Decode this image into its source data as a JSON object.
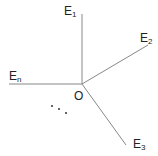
{
  "diagram": {
    "center": {
      "label": "O",
      "x": 82,
      "y": 84
    },
    "rays": [
      {
        "name": "E",
        "sub": "1",
        "x2": 82,
        "y2": 14,
        "lx": 64,
        "ly": 15
      },
      {
        "name": "E",
        "sub": "2",
        "x2": 148,
        "y2": 45,
        "lx": 140,
        "ly": 42
      },
      {
        "name": "E",
        "sub": "3",
        "x2": 126,
        "y2": 145,
        "lx": 133,
        "ly": 148
      },
      {
        "name": "E",
        "sub": "n",
        "x2": 9,
        "y2": 84,
        "lx": 9,
        "ly": 80
      }
    ],
    "ellipsis_dots": [
      {
        "x": 52,
        "y": 106
      },
      {
        "x": 59,
        "y": 109
      },
      {
        "x": 66,
        "y": 113
      }
    ],
    "colors": {
      "line": "#888888",
      "text": "#222222",
      "dot": "#333333"
    }
  }
}
